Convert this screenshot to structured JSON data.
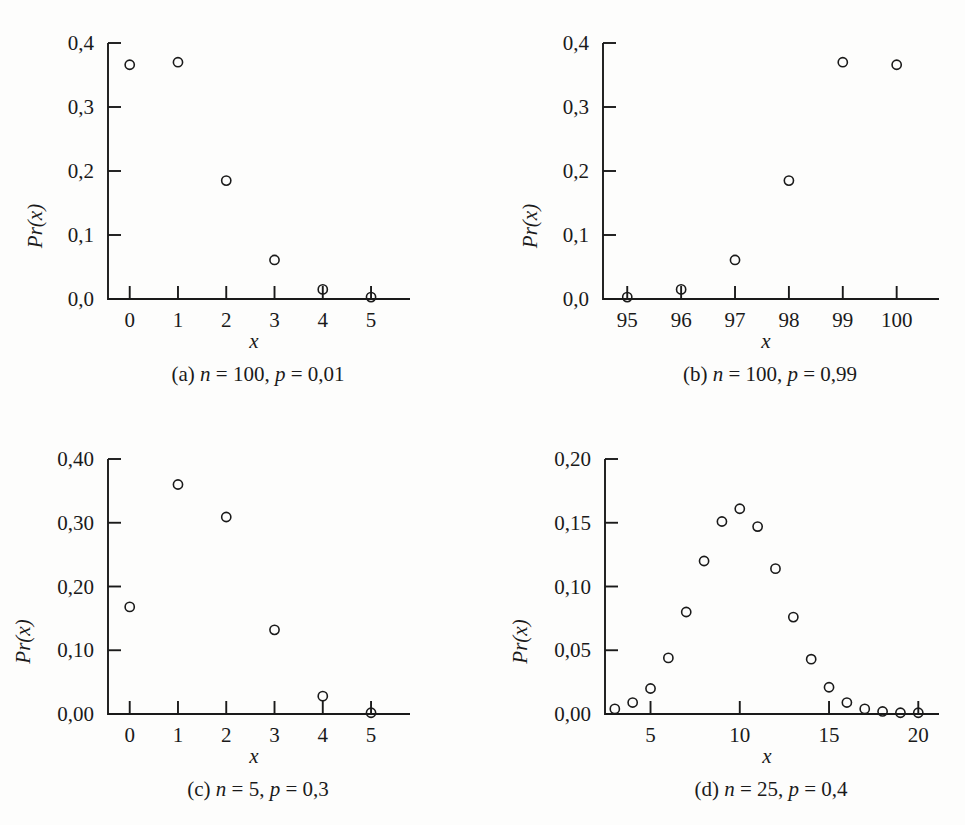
{
  "figure": {
    "axis_label_x": "x",
    "axis_label_y": "Pr(x)",
    "marker_style": "open-circle",
    "color": "#1a1a1a",
    "background": "#fdfdfc"
  },
  "panels": [
    {
      "id": "a",
      "caption_prefix": "(a)",
      "caption_n_sym": "n",
      "caption_n_val": "= 100,",
      "caption_p_sym": "p",
      "caption_p_val": "= 0,01",
      "caption_full": "(a) n = 100, p = 0,01",
      "xlabel": "x",
      "ylabel": "Pr(x)",
      "x_ticks": [
        "0",
        "1",
        "2",
        "3",
        "4",
        "5"
      ],
      "y_ticks": [
        "0,0",
        "0,1",
        "0,2",
        "0,3",
        "0,4"
      ]
    },
    {
      "id": "b",
      "caption_prefix": "(b)",
      "caption_n_sym": "n",
      "caption_n_val": "= 100,",
      "caption_p_sym": "p",
      "caption_p_val": "= 0,99",
      "caption_full": "(b) n = 100, p = 0,99",
      "xlabel": "x",
      "ylabel": "Pr(x)",
      "x_ticks": [
        "95",
        "96",
        "97",
        "98",
        "99",
        "100"
      ],
      "y_ticks": [
        "0,0",
        "0,1",
        "0,2",
        "0,3",
        "0,4"
      ]
    },
    {
      "id": "c",
      "caption_prefix": "(c)",
      "caption_n_sym": "n",
      "caption_n_val": "= 5,",
      "caption_p_sym": "p",
      "caption_p_val": "= 0,3",
      "caption_full": "(c) n = 5, p = 0,3",
      "xlabel": "x",
      "ylabel": "Pr(x)",
      "x_ticks": [
        "0",
        "1",
        "2",
        "3",
        "4",
        "5"
      ],
      "y_ticks": [
        "0,00",
        "0,10",
        "0,20",
        "0,30",
        "0,40"
      ]
    },
    {
      "id": "d",
      "caption_prefix": "(d)",
      "caption_n_sym": "n",
      "caption_n_val": "= 25,",
      "caption_p_sym": "p",
      "caption_p_val": "= 0,4",
      "caption_full": "(d) n = 25, p = 0,4",
      "xlabel": "x",
      "ylabel": "Pr(x)",
      "x_ticks": [
        "5",
        "10",
        "15",
        "20"
      ],
      "y_ticks": [
        "0,00",
        "0,05",
        "0,10",
        "0,15",
        "0,20"
      ]
    }
  ],
  "chart_data": [
    {
      "type": "scatter",
      "panel": "a",
      "title": "(a) n = 100, p = 0,01",
      "xlabel": "x",
      "ylabel": "Pr(x)",
      "xlim": [
        -0.45,
        5.6
      ],
      "ylim": [
        0.0,
        0.4
      ],
      "xticks": [
        0,
        1,
        2,
        3,
        4,
        5
      ],
      "xticklabels": [
        "0",
        "1",
        "2",
        "3",
        "4",
        "5"
      ],
      "yticks": [
        0.0,
        0.1,
        0.2,
        0.3,
        0.4
      ],
      "yticklabels": [
        "0,0",
        "0,1",
        "0,2",
        "0,3",
        "0,4"
      ],
      "grid": false,
      "legend": null,
      "x": [
        0,
        1,
        2,
        3,
        4,
        5
      ],
      "values": [
        0.366,
        0.37,
        0.185,
        0.061,
        0.015,
        0.003
      ]
    },
    {
      "type": "scatter",
      "panel": "b",
      "title": "(b) n = 100, p = 0,99",
      "xlabel": "x",
      "ylabel": "Pr(x)",
      "xlim": [
        94.55,
        100.6
      ],
      "ylim": [
        0.0,
        0.4
      ],
      "xticks": [
        95,
        96,
        97,
        98,
        99,
        100
      ],
      "xticklabels": [
        "95",
        "96",
        "97",
        "98",
        "99",
        "100"
      ],
      "yticks": [
        0.0,
        0.1,
        0.2,
        0.3,
        0.4
      ],
      "yticklabels": [
        "0,0",
        "0,1",
        "0,2",
        "0,3",
        "0,4"
      ],
      "grid": false,
      "legend": null,
      "x": [
        95,
        96,
        97,
        98,
        99,
        100
      ],
      "values": [
        0.003,
        0.015,
        0.061,
        0.185,
        0.37,
        0.366
      ]
    },
    {
      "type": "scatter",
      "panel": "c",
      "title": "(c) n = 5, p = 0,3",
      "xlabel": "x",
      "ylabel": "Pr(x)",
      "xlim": [
        -0.45,
        5.6
      ],
      "ylim": [
        0.0,
        0.4
      ],
      "xticks": [
        0,
        1,
        2,
        3,
        4,
        5
      ],
      "xticklabels": [
        "0",
        "1",
        "2",
        "3",
        "4",
        "5"
      ],
      "yticks": [
        0.0,
        0.1,
        0.2,
        0.3,
        0.4
      ],
      "yticklabels": [
        "0,00",
        "0,10",
        "0,20",
        "0,30",
        "0,40"
      ],
      "grid": false,
      "legend": null,
      "x": [
        0,
        1,
        2,
        3,
        4,
        5
      ],
      "values": [
        0.168,
        0.36,
        0.309,
        0.132,
        0.028,
        0.002
      ]
    },
    {
      "type": "scatter",
      "panel": "d",
      "title": "(d) n = 25, p = 0,4",
      "xlabel": "x",
      "ylabel": "Pr(x)",
      "xlim": [
        2.45,
        20.6
      ],
      "ylim": [
        0.0,
        0.2
      ],
      "xticks": [
        5,
        10,
        15,
        20
      ],
      "xticklabels": [
        "5",
        "10",
        "15",
        "20"
      ],
      "yticks": [
        0.0,
        0.05,
        0.1,
        0.15,
        0.2
      ],
      "yticklabels": [
        "0,00",
        "0,05",
        "0,10",
        "0,15",
        "0,20"
      ],
      "grid": false,
      "legend": null,
      "x": [
        3,
        4,
        5,
        6,
        7,
        8,
        9,
        10,
        11,
        12,
        13,
        14,
        15,
        16,
        17,
        18,
        19,
        20
      ],
      "values": [
        0.004,
        0.009,
        0.02,
        0.044,
        0.08,
        0.12,
        0.151,
        0.161,
        0.147,
        0.114,
        0.076,
        0.043,
        0.021,
        0.009,
        0.004,
        0.002,
        0.001,
        0.001
      ]
    }
  ]
}
